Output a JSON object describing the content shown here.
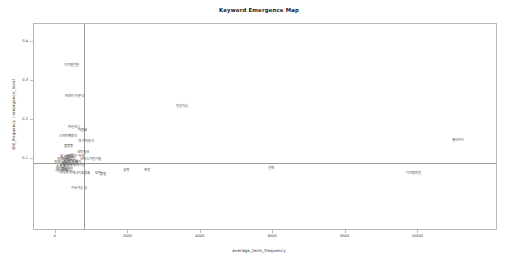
{
  "chart_data": {
    "type": "scatter",
    "title": "Keyword Emergence Map",
    "xlabel": "average_term_frequency",
    "ylabel": "std_frequency / emergence_level",
    "xlim": [
      -600,
      12200
    ],
    "ylim": [
      -0.085,
      0.445
    ],
    "grid": false,
    "legend": null,
    "reference_lines": {
      "vertical_x": 780,
      "horizontal_y": 0.088
    },
    "xticks": [
      0,
      2000,
      4000,
      6000,
      8000,
      10000
    ],
    "xtick_labels": [
      "0",
      "2000",
      "4000",
      "6000",
      "8000",
      "10000"
    ],
    "yticks": [
      0.4,
      0.3,
      0.2,
      0.1
    ],
    "ytick_labels": [
      "0.4",
      "0.3",
      "0.2",
      "0.1"
    ],
    "marker_style": "text-label",
    "points": [
      {
        "label": "디지털전환",
        "x": 430,
        "y": 0.338
      },
      {
        "label": "빅데이터분석",
        "x": 520,
        "y": 0.258
      },
      {
        "label": "인공지능",
        "x": 3480,
        "y": 0.232
      },
      {
        "label": "머신러닝",
        "x": 500,
        "y": 0.178
      },
      {
        "label": "자동화",
        "x": 740,
        "y": 0.172
      },
      {
        "label": "스마트팩토리",
        "x": 340,
        "y": 0.155
      },
      {
        "label": "클라우드",
        "x": 11100,
        "y": 0.145
      },
      {
        "label": "데이터분석",
        "x": 840,
        "y": 0.142
      },
      {
        "label": "플랫폼",
        "x": 360,
        "y": 0.13
      },
      {
        "label": "네트워크",
        "x": 760,
        "y": 0.115
      },
      {
        "label": "알고리즘",
        "x": 300,
        "y": 0.105
      },
      {
        "label": "사물인터넷",
        "x": 560,
        "y": 0.104
      },
      {
        "label": "시스템",
        "x": 240,
        "y": 0.101
      },
      {
        "label": "모델링",
        "x": 410,
        "y": 0.1
      },
      {
        "label": "서비스기반기술",
        "x": 960,
        "y": 0.098
      },
      {
        "label": "프로세스",
        "x": 200,
        "y": 0.096
      },
      {
        "label": "최적화",
        "x": 300,
        "y": 0.094
      },
      {
        "label": "아키텍처",
        "x": 430,
        "y": 0.092
      },
      {
        "label": "프레임워크",
        "x": 170,
        "y": 0.09
      },
      {
        "label": "센서",
        "x": 520,
        "y": 0.089
      },
      {
        "label": "제어",
        "x": 620,
        "y": 0.088
      },
      {
        "label": "로봇",
        "x": 250,
        "y": 0.086
      },
      {
        "label": "인터페이스",
        "x": 380,
        "y": 0.084
      },
      {
        "label": "시뮬레이션",
        "x": 600,
        "y": 0.082
      },
      {
        "label": "응용",
        "x": 190,
        "y": 0.08
      },
      {
        "label": "소프트웨어",
        "x": 230,
        "y": 0.078
      },
      {
        "label": "메타버스",
        "x": 180,
        "y": 0.072
      },
      {
        "label": "블록체인",
        "x": 310,
        "y": 0.07
      },
      {
        "label": "가상현실",
        "x": 160,
        "y": 0.066
      },
      {
        "label": "증강현실",
        "x": 280,
        "y": 0.063
      },
      {
        "label": "에너지효율화",
        "x": 700,
        "y": 0.06
      },
      {
        "label": "보안",
        "x": 1160,
        "y": 0.062
      },
      {
        "label": "품질",
        "x": 1310,
        "y": 0.058
      },
      {
        "label": "설계",
        "x": 1940,
        "y": 0.068
      },
      {
        "label": "측정",
        "x": 2510,
        "y": 0.069
      },
      {
        "label": "전략",
        "x": 5950,
        "y": 0.074
      },
      {
        "label": "디지털트윈",
        "x": 9870,
        "y": 0.062
      },
      {
        "label": "지속가능성",
        "x": 640,
        "y": 0.022
      }
    ]
  }
}
